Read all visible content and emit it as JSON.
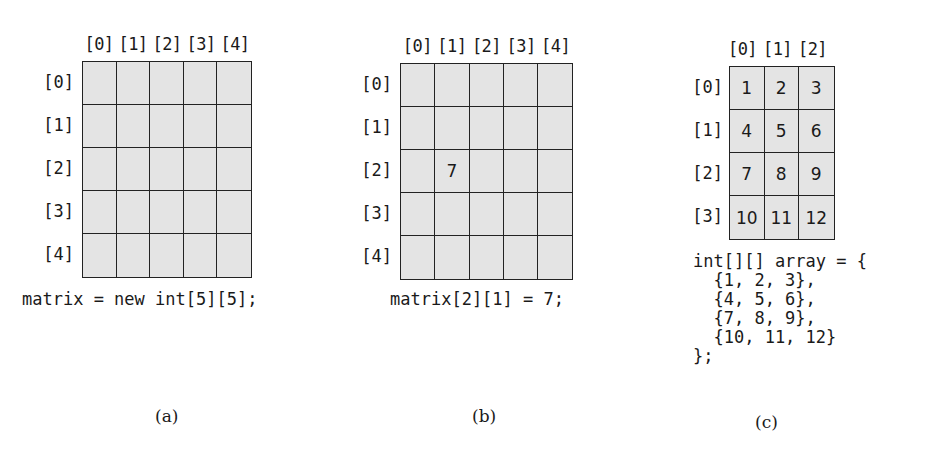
{
  "panels": [
    {
      "id": "a",
      "label": "(a)",
      "col_headers": [
        "[0]",
        "[1]",
        "[2]",
        "[3]",
        "[4]"
      ],
      "row_headers": [
        "[0]",
        "[1]",
        "[2]",
        "[3]",
        "[4]"
      ],
      "cells": [
        [
          "",
          "",
          "",
          "",
          ""
        ],
        [
          "",
          "",
          "",
          "",
          ""
        ],
        [
          "",
          "",
          "",
          "",
          ""
        ],
        [
          "",
          "",
          "",
          "",
          ""
        ],
        [
          "",
          "",
          "",
          "",
          ""
        ]
      ],
      "code": "matrix = new int[5][5];"
    },
    {
      "id": "b",
      "label": "(b)",
      "col_headers": [
        "[0]",
        "[1]",
        "[2]",
        "[3]",
        "[4]"
      ],
      "row_headers": [
        "[0]",
        "[1]",
        "[2]",
        "[3]",
        "[4]"
      ],
      "cells": [
        [
          "",
          "",
          "",
          "",
          ""
        ],
        [
          "",
          "",
          "",
          "",
          ""
        ],
        [
          "",
          "7",
          "",
          "",
          ""
        ],
        [
          "",
          "",
          "",
          "",
          ""
        ],
        [
          "",
          "",
          "",
          "",
          ""
        ]
      ],
      "code": "matrix[2][1] = 7;"
    },
    {
      "id": "c",
      "label": "(c)",
      "col_headers": [
        "[0]",
        "[1]",
        "[2]"
      ],
      "row_headers": [
        "[0]",
        "[1]",
        "[2]",
        "[3]"
      ],
      "cells": [
        [
          "1",
          "2",
          "3"
        ],
        [
          "4",
          "5",
          "6"
        ],
        [
          "7",
          "8",
          "9"
        ],
        [
          "10",
          "11",
          "12"
        ]
      ],
      "code": "int[][] array = {\n  {1, 2, 3},\n  {4, 5, 6},\n  {7, 8, 9},\n  {10, 11, 12}\n};"
    }
  ],
  "colors": {
    "cell_fill": "#e4e4e4",
    "grid_line": "#222222",
    "background": "#ffffff"
  }
}
